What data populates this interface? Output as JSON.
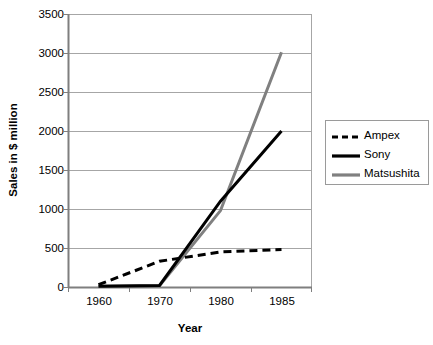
{
  "chart_data": {
    "type": "line",
    "title": "",
    "xlabel": "Year",
    "ylabel": "Sales in $ million",
    "categories": [
      "1960",
      "1970",
      "1980",
      "1985"
    ],
    "ylim": [
      0,
      3500
    ],
    "ytick_values": [
      0,
      500,
      1000,
      1500,
      2000,
      2500,
      3000,
      3500
    ],
    "ytick_labels": [
      "0",
      "500",
      "1000",
      "1500",
      "2000",
      "2500",
      "3000",
      "3500"
    ],
    "grid": "horizontal",
    "legend_position": "right",
    "series": [
      {
        "name": "Ampex",
        "values": [
          30,
          330,
          450,
          480
        ],
        "color": "#000000",
        "style": "dashed",
        "width": 3
      },
      {
        "name": "Sony",
        "values": [
          10,
          20,
          1100,
          2000
        ],
        "color": "#000000",
        "style": "solid",
        "width": 3
      },
      {
        "name": "Matsushita",
        "values": [
          10,
          15,
          980,
          3010
        ],
        "color": "#808080",
        "style": "solid",
        "width": 3
      }
    ]
  },
  "axis": {
    "y_title": "Sales in $ million",
    "x_title": "Year",
    "y_ticks": [
      "3500",
      "3000",
      "2500",
      "2000",
      "1500",
      "1000",
      "500",
      "0"
    ],
    "x_ticks": [
      "1960",
      "1970",
      "1980",
      "1985"
    ]
  },
  "legend": {
    "items": [
      {
        "label": "Ampex",
        "key": "dashed-line-key"
      },
      {
        "label": "Sony",
        "key": "solid-black-line-key"
      },
      {
        "label": "Matsushita",
        "key": "solid-gray-line-key"
      }
    ]
  },
  "colors": {
    "ampex": "#000000",
    "sony": "#000000",
    "matsushita": "#808080",
    "grid": "#a6a6a6",
    "axis": "#7f7f7f",
    "background": "#ffffff"
  }
}
